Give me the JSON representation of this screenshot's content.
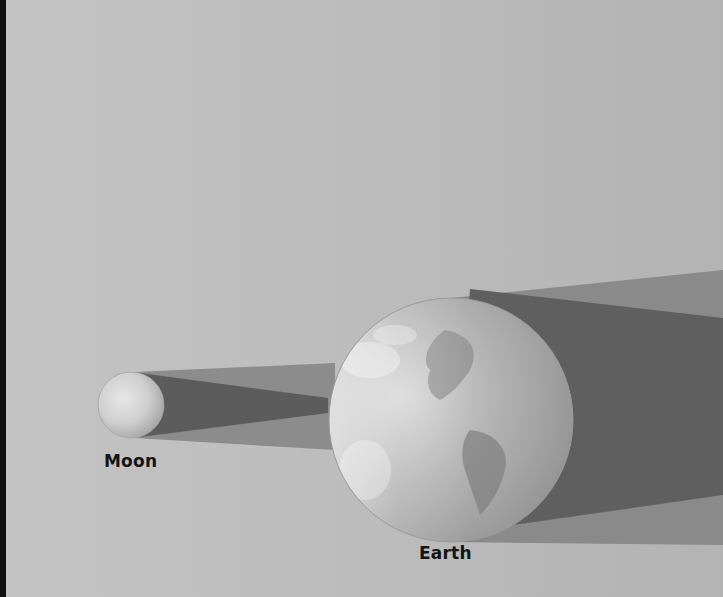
{
  "figure": {
    "colors": {
      "background": "#bdbdbd",
      "penumbra": "#8a8a8a",
      "umbra": "#5e5e5e",
      "label_text": "#141414"
    }
  },
  "bodies": [
    {
      "id": "moon",
      "label": "Moon"
    },
    {
      "id": "earth",
      "label": "Earth"
    }
  ],
  "shadows": [
    {
      "id": "moon-penumbra",
      "type": "penumbra",
      "cast_by": "Moon"
    },
    {
      "id": "moon-umbra",
      "type": "umbra",
      "cast_by": "Moon"
    },
    {
      "id": "earth-penumbra",
      "type": "penumbra",
      "cast_by": "Earth"
    },
    {
      "id": "earth-umbra",
      "type": "umbra",
      "cast_by": "Earth"
    }
  ]
}
